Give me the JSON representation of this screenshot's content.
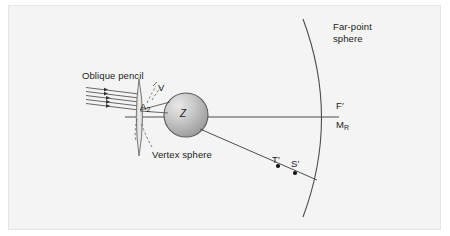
{
  "figure": {
    "background_color": "#ffffff",
    "panel_color": "#f4f4f4",
    "panel_border_color": "#e6e6e6",
    "line_color": "#4d4d4d",
    "text_color": "#1b1b1b",
    "sphere_fill_light": "#d9d9d9",
    "sphere_fill_dark": "#8f8f8f",
    "lens_fill": "#e0e0e0"
  },
  "labels": {
    "far_point_sphere_line1": "Far-point",
    "far_point_sphere_line2": "sphere",
    "oblique_pencil": "Oblique pencil",
    "v": "V",
    "a": "A",
    "a_subscript": "2",
    "z": "Z",
    "vertex_sphere": "Vertex sphere",
    "f_prime": "F′",
    "m": "M",
    "m_subscript": "R",
    "t_prime": "T′",
    "s_prime": "S′"
  },
  "elements": {
    "optical_axis": "horizontal-axis-line",
    "oblique_ray": "oblique-ray-to-far-point-sphere",
    "incident_pencil_rays": 5,
    "point_markers": [
      "T′",
      "S′"
    ],
    "arcs": [
      "vertex-sphere-arc",
      "far-point-sphere-arc"
    ],
    "dashed_leaders": [
      "v-leader",
      "a2-leader",
      "vertex-sphere-leader"
    ]
  }
}
